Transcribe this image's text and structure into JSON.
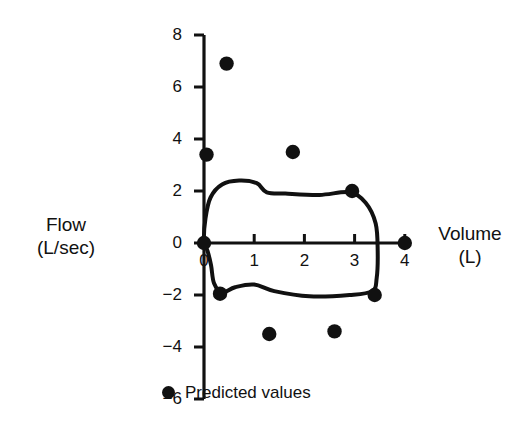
{
  "chart_data": {
    "type": "scatter",
    "title": "",
    "xlabel": "Volume (L)",
    "ylabel": "Flow (L/sec)",
    "xlabel_line1": "Volume",
    "xlabel_line2": "(L)",
    "ylabel_line1": "Flow",
    "ylabel_line2": "(L/sec)",
    "xlim": [
      0,
      4
    ],
    "ylim": [
      -6,
      8
    ],
    "xticks": [
      0,
      1,
      2,
      3,
      4
    ],
    "yticks": [
      8,
      6,
      4,
      2,
      0,
      -2,
      -4,
      -6
    ],
    "xticklabels": [
      "0",
      "1",
      "2",
      "3",
      "4"
    ],
    "yticklabels": [
      "8",
      "6",
      "4",
      "2",
      "0",
      "−2",
      "−4",
      "−6"
    ],
    "grid": false,
    "legend_position": "bottom-left",
    "accent_color": "#111111",
    "series": [
      {
        "name": "Predicted values",
        "type": "scatter",
        "marker": "circle",
        "color": "#111111",
        "points": [
          {
            "x": 0.45,
            "y": 6.9
          },
          {
            "x": 0.05,
            "y": 3.4
          },
          {
            "x": 1.77,
            "y": 3.5
          },
          {
            "x": 2.95,
            "y": 2.0
          },
          {
            "x": 0.0,
            "y": 0.0
          },
          {
            "x": 4.0,
            "y": 0.0
          },
          {
            "x": 0.32,
            "y": -1.95
          },
          {
            "x": 3.4,
            "y": -2.0
          },
          {
            "x": 1.3,
            "y": -3.5
          },
          {
            "x": 2.6,
            "y": -3.4
          }
        ]
      },
      {
        "name": "Flow-volume loop",
        "type": "closed-curve",
        "color": "#111111",
        "vertices": [
          {
            "x": 0.0,
            "y": 0.05
          },
          {
            "x": 0.03,
            "y": 0.95
          },
          {
            "x": 0.13,
            "y": 1.75
          },
          {
            "x": 0.36,
            "y": 2.25
          },
          {
            "x": 0.7,
            "y": 2.4
          },
          {
            "x": 1.05,
            "y": 2.3
          },
          {
            "x": 1.25,
            "y": 1.95
          },
          {
            "x": 1.62,
            "y": 1.9
          },
          {
            "x": 2.3,
            "y": 1.85
          },
          {
            "x": 2.9,
            "y": 1.95
          },
          {
            "x": 3.22,
            "y": 1.55
          },
          {
            "x": 3.42,
            "y": 0.75
          },
          {
            "x": 3.46,
            "y": -0.3
          },
          {
            "x": 3.44,
            "y": -1.35
          },
          {
            "x": 3.35,
            "y": -1.85
          },
          {
            "x": 2.9,
            "y": -2.0
          },
          {
            "x": 2.1,
            "y": -2.05
          },
          {
            "x": 1.4,
            "y": -1.85
          },
          {
            "x": 1.0,
            "y": -1.6
          },
          {
            "x": 0.62,
            "y": -1.7
          },
          {
            "x": 0.36,
            "y": -1.9
          },
          {
            "x": 0.2,
            "y": -1.55
          },
          {
            "x": 0.14,
            "y": -0.85
          },
          {
            "x": 0.07,
            "y": -0.3
          }
        ]
      }
    ],
    "legend": [
      {
        "label": "Predicted values",
        "marker": "circle",
        "color": "#111111"
      }
    ]
  }
}
